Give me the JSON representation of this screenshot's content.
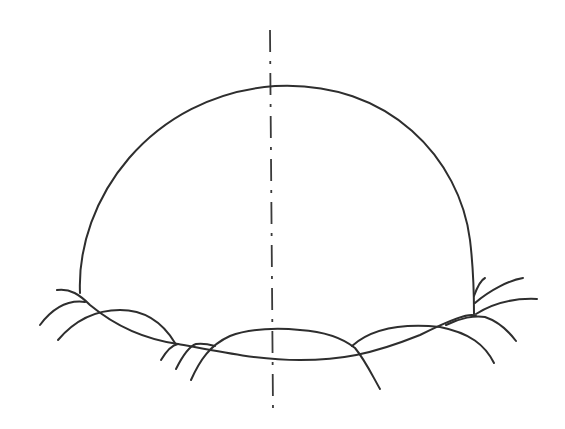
{
  "drawing": {
    "description": "Pencil sketch of a dome (hemisphere) resting on an elliptical base with overlapping arched strokes and a dashed vertical center axis",
    "stroke_color": "#2e2e2e",
    "background_color": "#ffffff",
    "elements": [
      {
        "name": "dome-outline",
        "label": "Dome outline"
      },
      {
        "name": "base-ellipse",
        "label": "Elliptical base"
      },
      {
        "name": "center-axis",
        "label": "Dashed vertical center axis"
      },
      {
        "name": "base-arches",
        "label": "Overlapping arch strokes around base"
      }
    ]
  }
}
